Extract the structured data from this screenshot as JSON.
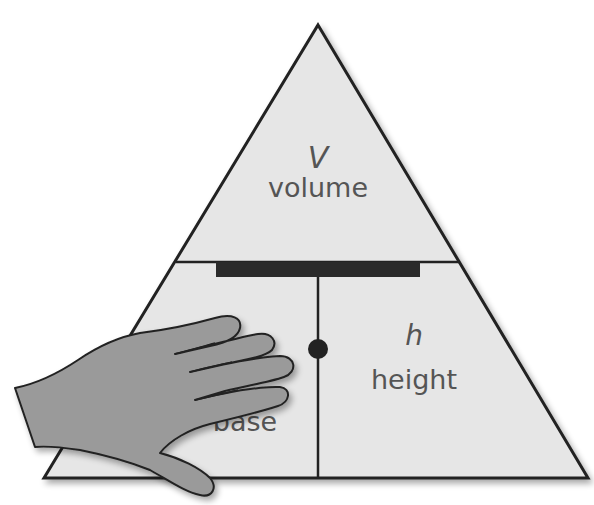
{
  "diagram": {
    "type": "formula-triangle",
    "colors": {
      "fill": "#e6e6e6",
      "stroke": "#222222",
      "text": "#555555",
      "hand_fill": "#9a9a9a",
      "bar": "#2a2a2a"
    },
    "top": {
      "symbol": "V",
      "label": "volume"
    },
    "bottom_left": {
      "symbol": "",
      "label": "base",
      "visible_fragment": "ase",
      "covered_by_hand": true
    },
    "bottom_right": {
      "symbol": "h",
      "label": "height"
    },
    "operators": {
      "divide_bar": "division",
      "multiply_dot": "multiplication"
    }
  }
}
